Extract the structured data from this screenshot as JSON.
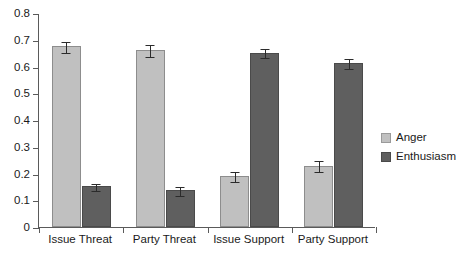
{
  "chart_data": {
    "type": "bar",
    "title": "",
    "subtitle": "",
    "xlabel": "",
    "ylabel": "",
    "ylim": [
      0,
      0.8
    ],
    "ytick_values": [
      0,
      0.1,
      0.2,
      0.3,
      0.4,
      0.5,
      0.6,
      0.7,
      0.8
    ],
    "ytick_labels": [
      "0",
      "0.1",
      "0.2",
      "0.3",
      "0.4",
      "0.5",
      "0.6",
      "0.7",
      "0.8"
    ],
    "grid": false,
    "legend_position": "right",
    "categories": [
      "Issue Threat",
      "Party Threat",
      "Issue Support",
      "Party Support"
    ],
    "series": [
      {
        "name": "Anger",
        "color": "#c0c0c0",
        "values": [
          0.675,
          0.662,
          0.19,
          0.229
        ],
        "errors": [
          0.022,
          0.022,
          0.018,
          0.021
        ]
      },
      {
        "name": "Enthusiasm",
        "color": "#5f5f5f",
        "values": [
          0.152,
          0.137,
          0.652,
          0.612
        ],
        "errors": [
          0.014,
          0.017,
          0.017,
          0.019
        ]
      }
    ]
  },
  "legend": {
    "items": [
      {
        "label": "Anger",
        "swatch": "anger"
      },
      {
        "label": "Enthusiasm",
        "swatch": "enthusiasm"
      }
    ]
  }
}
